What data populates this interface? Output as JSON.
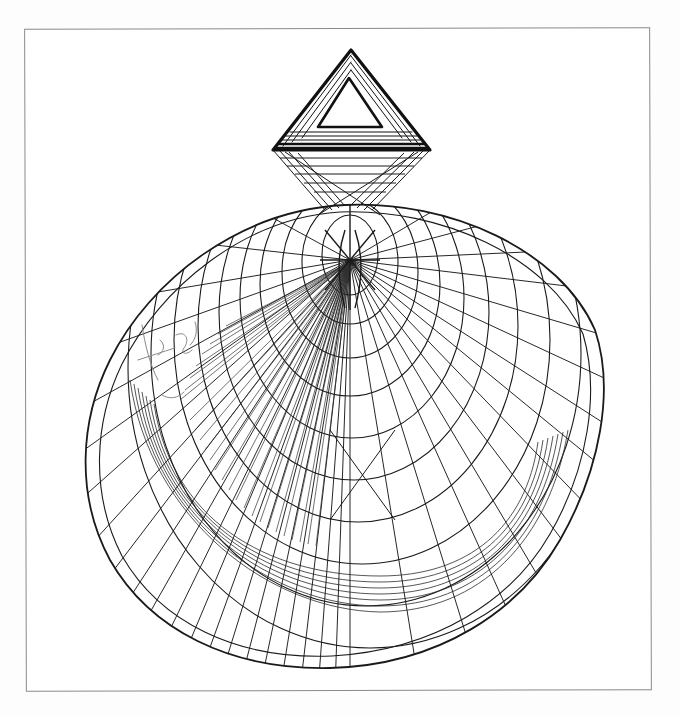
{
  "artwork": {
    "description": "Hand-drawn ink line drawing of a stylized shell / funnel figure topped by a hatched triangle, inside a thin rectangular frame",
    "medium": "ink / pen on white paper",
    "colors": {
      "paper": "#ffffff",
      "ink": "#1a1a1a",
      "frame": "#8a8a8a",
      "faint_pencil": "#9a9a9a"
    },
    "elements": {
      "frame": {
        "label": "thin gray rectangular border"
      },
      "triangle": {
        "label": "hatched triangle with hollow inner triangle at top"
      },
      "funnel": {
        "label": "converging lines connecting triangle base to shell apex"
      },
      "shell": {
        "label": "tilted egg-shaped shell with concentric arcs and radial lines"
      },
      "focal_point": {
        "label": "dense radial convergence point near the shell apex"
      },
      "inner_band": {
        "label": "dense concentric banding around lower interior"
      },
      "scribble": {
        "label": "faint handwritten scribble on left side of shell"
      }
    }
  }
}
